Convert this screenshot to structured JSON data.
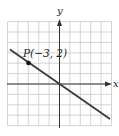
{
  "figure": {
    "x_axis_label": "x",
    "y_axis_label": "y",
    "point_label": "P(−3, 2)",
    "point": {
      "x": -3,
      "y": 2
    },
    "line": {
      "slope": -0.6667,
      "intercept": 0,
      "through": [
        [
          -3,
          2
        ],
        [
          0,
          0
        ]
      ]
    },
    "grid": {
      "x_min": -5,
      "x_max": 5,
      "y_min": -4,
      "y_max": 6,
      "step": 1
    },
    "colors": {
      "grid": "#c8c8c8",
      "axis": "#333333",
      "line": "#3a3a3a",
      "point": "#111111",
      "text": "#222222"
    }
  }
}
